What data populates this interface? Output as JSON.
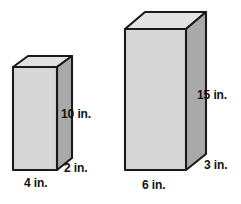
{
  "figure": {
    "type": "geometry-diagram",
    "background_color": "#ffffff",
    "colors": {
      "front_face": "#d7d7d7",
      "top_face": "#e2e2e2",
      "side_face": "#a9a9a9",
      "outline": "#1a1a1a",
      "label_text": "#111111"
    },
    "prisms": [
      {
        "name": "small-prism",
        "dimensions": {
          "height": "10 in.",
          "depth": "2 in.",
          "width": "4 in."
        }
      },
      {
        "name": "large-prism",
        "dimensions": {
          "height": "15 in.",
          "depth": "3 in.",
          "width": "6 in."
        }
      }
    ]
  },
  "labels": {
    "small_height": "10 in.",
    "small_depth": "2 in.",
    "small_width": "4 in.",
    "large_height": "15 in.",
    "large_depth": "3 in.",
    "large_width": "6 in."
  }
}
